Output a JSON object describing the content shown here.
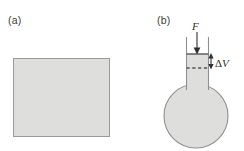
{
  "figure": {
    "width": 244,
    "height": 151,
    "background_color": "#ffffff",
    "fill_color": "#dededd",
    "stroke_color": "#8f8f8f",
    "ink_color": "#2f2f2f"
  },
  "panels": [
    {
      "id": "a",
      "label": "(a)",
      "description": "solid-block-rectangle",
      "shape": "rectangle",
      "rect": {
        "x": 13,
        "y": 58,
        "width": 97,
        "height": 79
      }
    },
    {
      "id": "b",
      "label": "(b)",
      "description": "round-bottom-flask-with-piston",
      "shape": "flask",
      "bulb": {
        "cx": 196,
        "cy": 116,
        "r": 32
      },
      "neck": {
        "x": 186,
        "y": 37,
        "width": 23,
        "height": 50
      },
      "piston_line_y": 54,
      "dashed_line_y": 68
    }
  ],
  "annotations": {
    "force_label": "F",
    "force_arrow": {
      "name": "downward-force-arrow",
      "from_y": 32,
      "to_y": 54,
      "x": 197,
      "direction": "down"
    },
    "volume_change_delta": "Δ",
    "volume_change_symbol": "V",
    "volume_change_label": "ΔV",
    "volume_arrow": {
      "name": "delta-volume-double-arrow",
      "x": 211,
      "top_y": 54,
      "bottom_y": 68,
      "direction": "both"
    }
  }
}
